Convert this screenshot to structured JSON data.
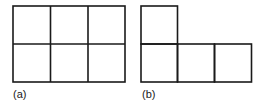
{
  "figures": [
    {
      "id": "a",
      "label": "(a)",
      "description": "2x3 grid of six unit squares",
      "rows": 2,
      "cols": 3,
      "cells": [
        [
          0,
          0
        ],
        [
          0,
          1
        ],
        [
          0,
          2
        ],
        [
          1,
          0
        ],
        [
          1,
          1
        ],
        [
          1,
          2
        ]
      ]
    },
    {
      "id": "b",
      "label": "(b)",
      "description": "L-shaped arrangement of four unit squares: one on top-left, three in bottom row",
      "cells": [
        [
          0,
          0
        ],
        [
          1,
          0
        ],
        [
          1,
          1
        ],
        [
          1,
          2
        ]
      ]
    }
  ],
  "colors": {
    "stroke": "#1a1a1a",
    "background": "#ffffff"
  }
}
